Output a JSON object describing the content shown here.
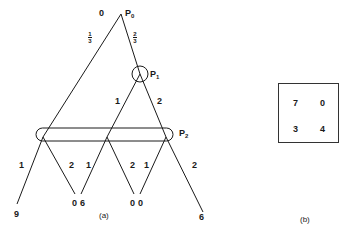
{
  "figure_a": {
    "caption": "(a)",
    "root": {
      "label": "P",
      "sub": "0",
      "value": "0"
    },
    "root_branches": {
      "left_prob_num": "1",
      "left_prob_den": "3",
      "right_prob_num": "2",
      "right_prob_den": "3"
    },
    "p1": {
      "label": "P",
      "sub": "1",
      "branch_left": "1",
      "branch_right": "2"
    },
    "p2": {
      "label": "P",
      "sub": "2"
    },
    "branches": [
      {
        "label": "1"
      },
      {
        "label": "2"
      },
      {
        "label": "1"
      },
      {
        "label": "2"
      },
      {
        "label": "1"
      },
      {
        "label": "2"
      }
    ],
    "leaves": [
      {
        "value": "9"
      },
      {
        "value": "0"
      },
      {
        "value": "6"
      },
      {
        "value": "0"
      },
      {
        "value": "0"
      },
      {
        "value": "6"
      }
    ]
  },
  "figure_b": {
    "caption": "(b)",
    "matrix": [
      [
        "7",
        "0"
      ],
      [
        "3",
        "4"
      ]
    ]
  }
}
